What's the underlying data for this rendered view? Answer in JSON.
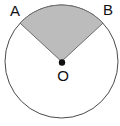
{
  "figure": {
    "canvas": {
      "width": 120,
      "height": 126,
      "background": "#ffffff"
    },
    "circle": {
      "center_x": 61.5,
      "center_y": 61.5,
      "radius": 56.5,
      "stroke_color": "#4a4a4a",
      "stroke_width": 1,
      "fill_color": "#ffffff"
    },
    "sector": {
      "fill_color": "#bcbcbc",
      "stroke_color": "#6b6b6b",
      "stroke_width": 1,
      "start_angle_deg": 42.8,
      "end_angle_deg": 137.2,
      "central_angle_deg": 94.4,
      "point_a_x": 21.0,
      "point_a_y": 23.2,
      "point_b_x": 102.0,
      "point_b_y": 23.2
    },
    "center_marker": {
      "x": 62.0,
      "y": 62.5,
      "radius": 3.2,
      "color": "#111111"
    },
    "labels": {
      "a": {
        "text": "A",
        "x": 15.0,
        "y": 12.0
      },
      "b": {
        "text": "B",
        "x": 108.0,
        "y": 11.0
      },
      "o": {
        "text": "O",
        "x": 63.0,
        "y": 77.0
      }
    }
  }
}
